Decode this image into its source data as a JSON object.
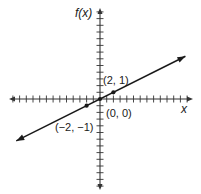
{
  "chart_data": {
    "type": "line",
    "title": "",
    "xlabel": "x",
    "ylabel": "f(x)",
    "xlim": [
      -13.5,
      13.5
    ],
    "ylim": [
      -13.5,
      13.5
    ],
    "x_ticks_unlabeled": [
      -13,
      -12,
      -11,
      -10,
      -9,
      -8,
      -7,
      -6,
      -5,
      -4,
      -3,
      -2,
      -1,
      1,
      2,
      3,
      4,
      5,
      6,
      7,
      8,
      9,
      10,
      11,
      12,
      13
    ],
    "y_ticks_unlabeled": [
      -13,
      -12,
      -11,
      -10,
      -9,
      -8,
      -7,
      -6,
      -5,
      -4,
      -3,
      -2,
      -1,
      1,
      2,
      3,
      4,
      5,
      6,
      7,
      8,
      9,
      10,
      11,
      12,
      13
    ],
    "grid": false,
    "series": [
      {
        "name": "f(x) = x/2",
        "slope": 0.5,
        "intercept": 0,
        "x": [
          -12.5,
          12.75
        ],
        "y": [
          -6.25,
          6.375
        ],
        "arrows_both_ends": true
      }
    ],
    "points": [
      {
        "x": 2,
        "y": 1,
        "label": "(2, 1)"
      },
      {
        "x": 0,
        "y": 0,
        "label": "(0, 0)"
      },
      {
        "x": -2,
        "y": -1,
        "label": "(−2, −1)"
      }
    ]
  },
  "labels": {
    "x_axis": "x",
    "y_axis": "f(x)",
    "point_2_1": "(2, 1)",
    "point_0_0": "(0, 0)",
    "point_m2_m1": "(−2, −1)"
  },
  "colors": {
    "axis": "#333333",
    "line": "#1a1a1a",
    "background": "#ffffff"
  }
}
